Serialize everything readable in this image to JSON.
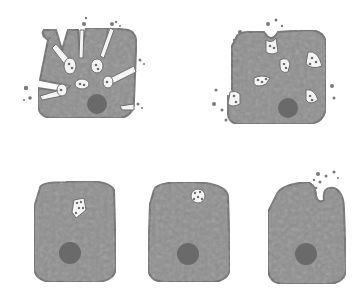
{
  "figure": {
    "type": "cell-secretion-illustration",
    "background": "#ffffff",
    "colors": {
      "cytoplasm": "#8f8f8f",
      "cytoplasm_edge": "#6f6f6f",
      "nucleus": "#6a6a6a",
      "vesicle": "#f4f4f4",
      "granule": "#6e6e6e",
      "droplet": "#7a7a7a"
    },
    "panels": [
      {
        "id": "top-left",
        "description": "cell with multiple channels releasing vesicle contents"
      },
      {
        "id": "top-right",
        "description": "cell with several granule-filled vesicles fusing at membrane"
      },
      {
        "id": "bottom-1",
        "description": "cell with granule vesicle in cytoplasm"
      },
      {
        "id": "bottom-2",
        "description": "vesicle approaching apical membrane"
      },
      {
        "id": "bottom-3",
        "description": "vesicle fused, releasing granules (exocytosis)"
      }
    ]
  }
}
